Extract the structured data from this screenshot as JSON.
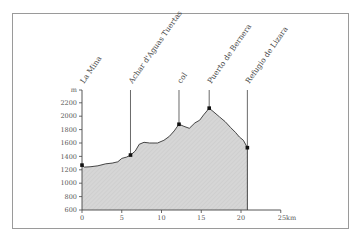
{
  "chart_data": {
    "type": "area",
    "title": "",
    "xlabel": "km",
    "ylabel": "m",
    "xlim": [
      0,
      25
    ],
    "ylim": [
      600,
      2300
    ],
    "x_ticks": [
      "0",
      "5",
      "10",
      "15",
      "20",
      "25km"
    ],
    "y_ticks": [
      "600",
      "800",
      "1000",
      "1200",
      "1400",
      "1600",
      "1800",
      "2000",
      "2200",
      "m"
    ],
    "grid": false,
    "legend": null,
    "fill_color": "#d4d4d4",
    "line_color": "#333333",
    "profile": {
      "x": [
        0,
        0.3,
        1,
        2,
        3,
        3.8,
        4.5,
        5,
        5.6,
        6.1,
        6.7,
        7.2,
        7.8,
        8.5,
        9.5,
        10.3,
        11,
        11.6,
        12.2,
        12.8,
        13.5,
        14.2,
        14.8,
        15.3,
        16,
        16.6,
        17.3,
        18,
        18.7,
        19.3,
        19.8,
        20.3,
        20.8
      ],
      "y": [
        1270,
        1240,
        1245,
        1260,
        1290,
        1300,
        1320,
        1370,
        1390,
        1420,
        1480,
        1580,
        1610,
        1600,
        1600,
        1640,
        1700,
        1780,
        1880,
        1850,
        1820,
        1900,
        1940,
        2020,
        2120,
        2060,
        1990,
        1920,
        1830,
        1760,
        1690,
        1640,
        1530
      ]
    },
    "markers": [
      {
        "label": "La Mina",
        "x": 0,
        "y": 1270
      },
      {
        "label": "Achar d'Aguas Tuertas",
        "x": 6.1,
        "y": 1420
      },
      {
        "label": "col",
        "x": 12.2,
        "y": 1880
      },
      {
        "label": "Puerto de Bernera",
        "x": 16,
        "y": 2120
      },
      {
        "label": "Refugio de Lizara",
        "x": 20.8,
        "y": 1530
      }
    ]
  },
  "labels": {
    "y_unit": "m",
    "x_ticks": [
      "0",
      "5",
      "10",
      "15",
      "20",
      "25km"
    ],
    "y_ticks": [
      "2200",
      "2000",
      "1800",
      "1600",
      "1400",
      "1200",
      "1000",
      "800",
      "600"
    ],
    "places": [
      "La Mina",
      "Achar d'Aguas Tuertas",
      "col",
      "Puerto de Bernera",
      "Refugio de Lizara"
    ]
  }
}
